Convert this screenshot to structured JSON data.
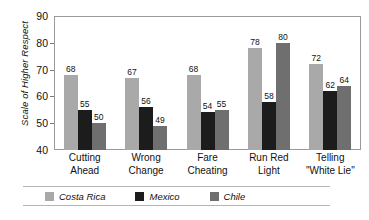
{
  "chart_data": {
    "type": "bar",
    "title": "",
    "xlabel": "",
    "ylabel": "Scale of Higher Respect",
    "ylim": [
      40,
      90
    ],
    "yticks": [
      40,
      50,
      60,
      70,
      80,
      90
    ],
    "grid": false,
    "legend_position": "bottom",
    "categories": [
      "Cutting Ahead",
      "Wrong Change",
      "Fare Cheating",
      "Run Red Light",
      "Telling \"White Lie\""
    ],
    "category_lines": [
      [
        "Cutting",
        "Ahead"
      ],
      [
        "Wrong",
        "Change"
      ],
      [
        "Fare",
        "Cheating"
      ],
      [
        "Run Red",
        "Light"
      ],
      [
        "Telling",
        "\"White Lie\""
      ]
    ],
    "series": [
      {
        "name": "Costa Rica",
        "color": "#a9a9a9",
        "values": [
          68,
          67,
          68,
          78,
          72
        ]
      },
      {
        "name": "Mexico",
        "color": "#1c1c1c",
        "values": [
          55,
          56,
          54,
          58,
          62
        ]
      },
      {
        "name": "Chile",
        "color": "#6f6f6f",
        "values": [
          50,
          49,
          55,
          80,
          64
        ]
      }
    ]
  },
  "axis": {
    "y_title": "Scale of Higher Respect",
    "y_tick_labels": [
      "90",
      "80",
      "70",
      "60",
      "50",
      "40"
    ]
  },
  "legend": {
    "items": [
      {
        "label": "Costa Rica",
        "color": "#a9a9a9"
      },
      {
        "label": "Mexico",
        "color": "#1c1c1c"
      },
      {
        "label": "Chile",
        "color": "#6f6f6f"
      }
    ]
  }
}
